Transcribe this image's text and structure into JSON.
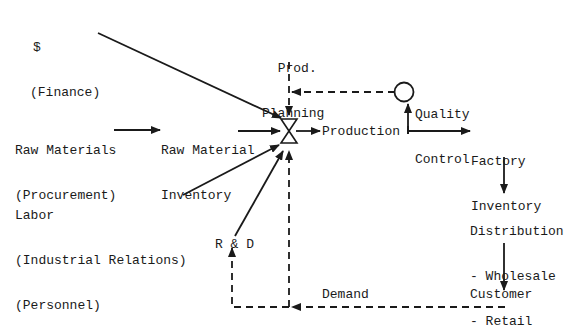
{
  "diagram": {
    "type": "flow-diagram",
    "colors": {
      "ink": "#1a1a1a",
      "background": "#ffffff"
    },
    "nodes": {
      "finance": {
        "line1": "$",
        "line2": "(Finance)"
      },
      "raw_materials": {
        "line1": "Raw Materials",
        "line2": "(Procurement)"
      },
      "raw_material_inventory": {
        "line1": "Raw Material",
        "line2": "Inventory"
      },
      "labor": {
        "line1": "Labor",
        "line2": "(Industrial Relations)",
        "line3": "(Personnel)"
      },
      "prod_planning": {
        "line1": "Prod.",
        "line2": "Planning"
      },
      "production": {
        "label": "Production"
      },
      "quality_control": {
        "line1": "Quality",
        "line2": "Control"
      },
      "factory_inventory": {
        "line1": "Factory",
        "line2": "Inventory"
      },
      "distribution": {
        "line1": "Distribution",
        "line2": "- Wholesale",
        "line3": "- Retail"
      },
      "customer": {
        "label": "Customer"
      },
      "rnd": {
        "label": "R & D"
      },
      "demand": {
        "label": "Demand"
      }
    },
    "edges": [
      {
        "from": "finance",
        "to": "valve",
        "style": "solid"
      },
      {
        "from": "raw_materials",
        "to": "raw_material_inventory",
        "style": "solid"
      },
      {
        "from": "raw_material_inventory",
        "to": "valve",
        "style": "solid"
      },
      {
        "from": "labor",
        "to": "valve",
        "style": "solid"
      },
      {
        "from": "rnd",
        "to": "valve",
        "style": "solid"
      },
      {
        "from": "prod_planning",
        "to": "valve",
        "style": "dashed"
      },
      {
        "from": "quality_control",
        "to": "valve",
        "style": "dashed"
      },
      {
        "from": "valve",
        "to": "production",
        "style": "solid"
      },
      {
        "from": "production",
        "to": "quality_control",
        "style": "solid"
      },
      {
        "from": "production",
        "to": "factory_inventory",
        "style": "solid"
      },
      {
        "from": "factory_inventory",
        "to": "distribution",
        "style": "solid"
      },
      {
        "from": "distribution",
        "to": "customer",
        "style": "solid"
      },
      {
        "from": "customer",
        "to": "valve",
        "style": "dashed",
        "label": "Demand"
      },
      {
        "from": "customer",
        "to": "rnd",
        "style": "dashed"
      }
    ]
  }
}
